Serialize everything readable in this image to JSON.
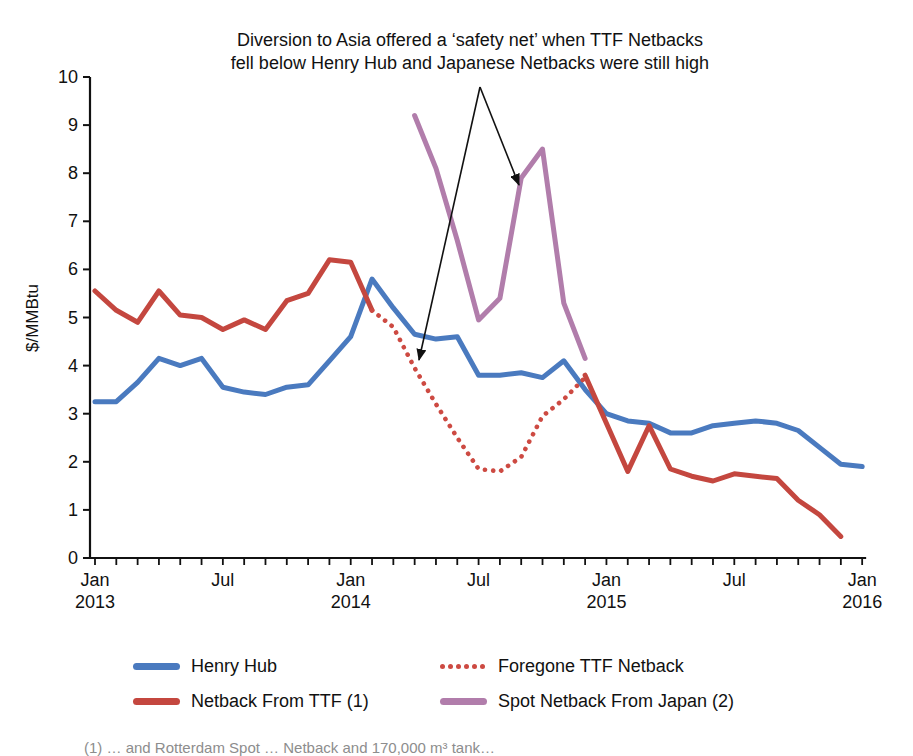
{
  "annotation": {
    "line1": "Diversion to Asia offered a ‘safety net’ when TTF Netbacks",
    "line2": "fell below Henry Hub and Japanese Netbacks were still high"
  },
  "y_axis": {
    "title": "$/MMBtu",
    "min": 0,
    "max": 10,
    "tick_step": 1,
    "tick_labels": [
      "0",
      "1",
      "2",
      "3",
      "4",
      "5",
      "6",
      "7",
      "8",
      "9",
      "10"
    ]
  },
  "x_axis": {
    "months_total": 37,
    "first_month": "Jan 2013",
    "last_month": "Jan 2016",
    "tick_labels": [
      {
        "index": 0,
        "month": "Jan",
        "year": "2013"
      },
      {
        "index": 6,
        "month": "Jul",
        "year": ""
      },
      {
        "index": 12,
        "month": "Jan",
        "year": "2014"
      },
      {
        "index": 18,
        "month": "Jul",
        "year": ""
      },
      {
        "index": 24,
        "month": "Jan",
        "year": "2015"
      },
      {
        "index": 30,
        "month": "Jul",
        "year": ""
      },
      {
        "index": 36,
        "month": "Jan",
        "year": "2016"
      }
    ]
  },
  "legend": {
    "items": [
      {
        "label": "Henry Hub",
        "color": "#4a7abf",
        "style": "solid"
      },
      {
        "label": "Foregone TTF Netback",
        "color": "#cd4a42",
        "style": "dotted"
      },
      {
        "label": "Netback From TTF (1)",
        "color": "#c4473f",
        "style": "solid"
      },
      {
        "label": "Spot Netback From Japan (2)",
        "color": "#b17dab",
        "style": "solid"
      }
    ]
  },
  "footnote_fragment": "(1) … and Rotterdam Spot … Netback and 170,000 m³ tank…",
  "chart_data": {
    "type": "line",
    "x_unit": "month",
    "x_start": "2013-01",
    "x_end": "2016-01",
    "ylim": [
      0,
      10
    ],
    "ylabel": "$/MMBtu",
    "grid": false,
    "legend_position": "bottom",
    "series": [
      {
        "name": "Henry Hub",
        "color": "#4a7abf",
        "style": "solid",
        "start_month_index": 0,
        "values": [
          3.25,
          3.25,
          3.65,
          4.15,
          4.0,
          4.15,
          3.55,
          3.45,
          3.4,
          3.55,
          3.6,
          4.1,
          4.6,
          5.8,
          5.2,
          4.65,
          4.55,
          4.6,
          3.8,
          3.8,
          3.85,
          3.75,
          4.1,
          3.5,
          3.0,
          2.85,
          2.8,
          2.6,
          2.6,
          2.75,
          2.8,
          2.85,
          2.8,
          2.65,
          2.3,
          1.95,
          1.9
        ]
      },
      {
        "name": "Netback From TTF (1)",
        "segment": "2013-01 to 2014-02",
        "color": "#c4473f",
        "style": "solid",
        "start_month_index": 0,
        "values": [
          5.55,
          5.15,
          4.9,
          5.55,
          5.05,
          5.0,
          4.75,
          4.95,
          4.75,
          5.35,
          5.5,
          6.2,
          6.15,
          5.15
        ]
      },
      {
        "name": "Foregone TTF Netback",
        "segment": "2014-02 to 2014-12",
        "color": "#cd4a42",
        "style": "dotted",
        "start_month_index": 13,
        "values": [
          5.15,
          4.8,
          3.95,
          3.2,
          2.5,
          1.85,
          1.8,
          2.1,
          2.95,
          3.3,
          3.75
        ]
      },
      {
        "name": "Netback From TTF (1)",
        "segment": "2014-12 to 2015-12",
        "color": "#c4473f",
        "style": "solid",
        "start_month_index": 23,
        "values": [
          3.8,
          2.8,
          1.8,
          2.75,
          1.85,
          1.7,
          1.6,
          1.75,
          1.7,
          1.65,
          1.2,
          0.9,
          0.45
        ]
      },
      {
        "name": "Spot Netback From Japan (2)",
        "segment": "2014-04 to 2014-12",
        "color": "#b17dab",
        "style": "solid",
        "start_month_index": 15,
        "values": [
          9.2,
          8.1,
          6.6,
          4.95,
          5.4,
          7.9,
          8.5,
          5.3,
          4.15
        ]
      }
    ],
    "annotation_arrows": [
      {
        "from": [
          480,
          87
        ],
        "to": [
          519,
          185
        ]
      },
      {
        "from": [
          480,
          87
        ],
        "to": [
          419,
          360
        ]
      }
    ]
  }
}
